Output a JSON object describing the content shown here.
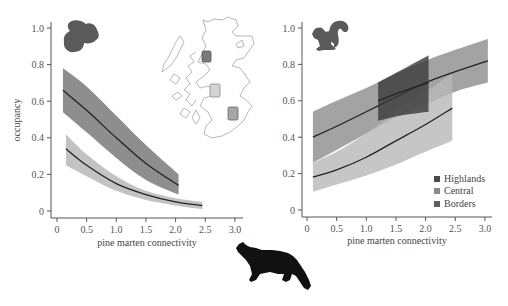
{
  "chart_data": [
    {
      "type": "line",
      "panel": "left",
      "title": "",
      "xlabel": "pine marten connectivity",
      "ylabel": "occupancy",
      "xlim": [
        0,
        3.0
      ],
      "ylim": [
        0,
        1.0
      ],
      "xticks": [
        "0",
        "0.5",
        "1.0",
        "1.5",
        "2.0",
        "2.5",
        "3.0"
      ],
      "yticks": [
        "0",
        "0.2",
        "0.4",
        "0.6",
        "0.8",
        "1.0"
      ],
      "grid": false,
      "species_icon": "red-squirrel",
      "series": [
        {
          "name": "upper curve (dark band)",
          "color": "#7a7a7a",
          "x": [
            0.1,
            0.5,
            1.0,
            1.5,
            2.05
          ],
          "mean": [
            0.66,
            0.55,
            0.4,
            0.26,
            0.14
          ],
          "upper": [
            0.78,
            0.68,
            0.52,
            0.36,
            0.2
          ],
          "lower": [
            0.54,
            0.43,
            0.29,
            0.17,
            0.09
          ]
        },
        {
          "name": "lower curve (light band)",
          "color": "#b8b8b8",
          "x": [
            0.15,
            0.5,
            1.0,
            1.5,
            2.0,
            2.45
          ],
          "mean": [
            0.34,
            0.25,
            0.15,
            0.09,
            0.05,
            0.03
          ],
          "upper": [
            0.42,
            0.31,
            0.19,
            0.11,
            0.07,
            0.05
          ],
          "lower": [
            0.25,
            0.19,
            0.11,
            0.06,
            0.03,
            0.01
          ]
        }
      ],
      "inset_map": {
        "label": "Scotland",
        "sites": [
          {
            "name": "Highlands",
            "color": "#7a7a7a"
          },
          {
            "name": "Central",
            "color": "#cfcfcf"
          },
          {
            "name": "Borders",
            "color": "#9e9e9e"
          }
        ]
      }
    },
    {
      "type": "line",
      "panel": "right",
      "title": "",
      "xlabel": "pine marten connectivity",
      "ylabel": "",
      "xlim": [
        0,
        3.0
      ],
      "ylim": [
        0,
        1.0
      ],
      "xticks": [
        "0",
        "0.5",
        "1.0",
        "1.5",
        "2.0",
        "2.5",
        "3.0"
      ],
      "yticks": [
        "0",
        "0.2",
        "0.4",
        "0.6",
        "0.8",
        "1.0"
      ],
      "grid": false,
      "species_icon": "grey-squirrel",
      "legend": {
        "position": "lower right",
        "entries": [
          "Highlands",
          "Central",
          "Borders"
        ]
      },
      "series": [
        {
          "name": "Borders",
          "color": "#8c8c8c",
          "x": [
            0.1,
            0.5,
            1.0,
            1.5,
            2.0,
            2.5,
            3.05
          ],
          "mean": [
            0.4,
            0.46,
            0.54,
            0.62,
            0.7,
            0.76,
            0.82
          ],
          "upper": [
            0.54,
            0.6,
            0.67,
            0.75,
            0.82,
            0.88,
            0.94
          ],
          "lower": [
            0.26,
            0.33,
            0.42,
            0.51,
            0.58,
            0.65,
            0.7
          ]
        },
        {
          "name": "Central",
          "color": "#b8b8b8",
          "x": [
            0.1,
            0.5,
            1.0,
            1.5,
            2.0,
            2.45
          ],
          "mean": [
            0.18,
            0.22,
            0.29,
            0.38,
            0.47,
            0.56
          ],
          "upper": [
            0.26,
            0.32,
            0.42,
            0.54,
            0.65,
            0.75
          ],
          "lower": [
            0.1,
            0.14,
            0.19,
            0.25,
            0.32,
            0.38
          ]
        },
        {
          "name": "Highlands",
          "color": "#3a3a3a",
          "x": [
            1.2,
            1.6,
            2.05
          ],
          "mean": [
            0.6,
            0.65,
            0.7
          ],
          "upper": [
            0.7,
            0.77,
            0.85
          ],
          "lower": [
            0.49,
            0.52,
            0.54
          ]
        }
      ]
    }
  ],
  "labels": {
    "left_ylabel": "occupancy",
    "left_xlabel": "pine marten connectivity",
    "right_xlabel": "pine marten connectivity",
    "xticks": [
      "0",
      "0.5",
      "1.0",
      "1.5",
      "2.0",
      "2.5",
      "3.0"
    ],
    "yticks": [
      "0",
      "0.2",
      "0.4",
      "0.6",
      "0.8",
      "1.0"
    ],
    "legend": [
      "Highlands",
      "Central",
      "Borders"
    ]
  },
  "colors": {
    "highlands": "#4a4a4a",
    "central": "#8a8a8a",
    "borders": "#5e5e5e",
    "axis": "#555555",
    "mean_line": "#222222"
  },
  "icons": [
    "red-squirrel-icon",
    "grey-squirrel-icon",
    "pine-marten-icon",
    "scotland-map-icon"
  ]
}
